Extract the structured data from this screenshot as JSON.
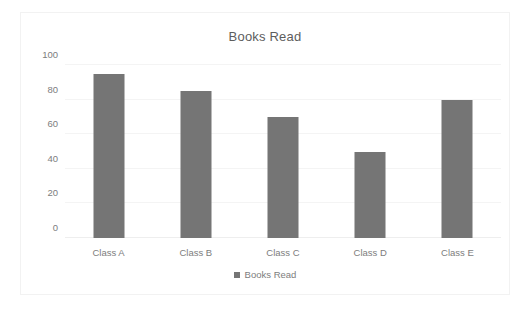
{
  "chart_data": {
    "type": "bar",
    "title": "Books Read",
    "categories": [
      "Class A",
      "Class B",
      "Class C",
      "Class D",
      "Class E"
    ],
    "values": [
      95,
      85,
      70,
      50,
      80
    ],
    "series": [
      {
        "name": "Books Read",
        "values": [
          95,
          85,
          70,
          50,
          80
        ]
      }
    ],
    "xlabel": "",
    "ylabel": "",
    "ylim": [
      0,
      100
    ],
    "yticks": [
      0,
      20,
      40,
      60,
      80,
      100
    ],
    "ytick_labels": [
      "0",
      "20",
      "40",
      "60",
      "80",
      "100"
    ],
    "grid": true,
    "legend": {
      "position": "bottom",
      "entries": [
        "Books Read"
      ]
    },
    "colors": {
      "bar": "#757575",
      "gridline": "#f4f4f4",
      "text": "#7d7d7d",
      "title_text": "#5d5d5d",
      "background": "#ffffff",
      "border": "#f2f2f2"
    }
  }
}
